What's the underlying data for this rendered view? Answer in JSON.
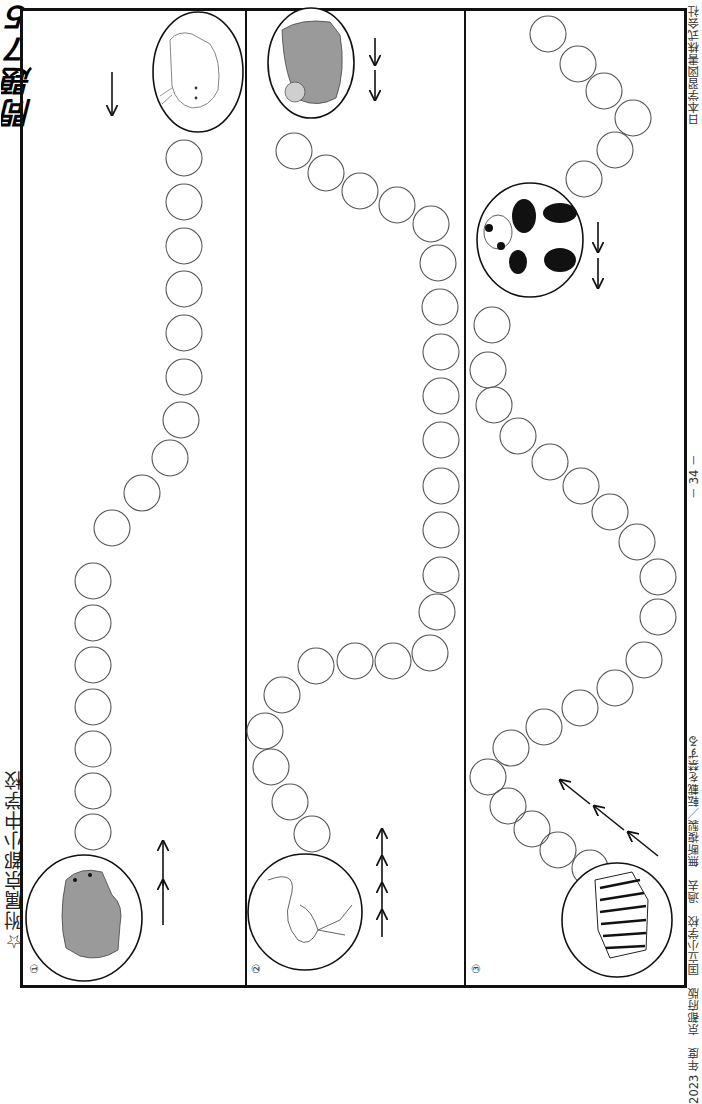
{
  "page": {
    "heading": "問題７５",
    "title": "☆附属京都小中学校",
    "footer": {
      "left": "2023 年度　京都府版　国立小学校　過去　無断複製／転載を禁ずる",
      "page_number": "－ 34 －",
      "right": "日本学習図書株式会社"
    }
  },
  "panels": [
    {
      "number": "①",
      "start_animal": "bear",
      "end_animal": "cat",
      "start_arrows": 2,
      "end_arrows": 1,
      "circle_count": 17
    },
    {
      "number": "②",
      "start_animal": "flamingo",
      "end_animal": "monkey",
      "start_arrows": 4,
      "end_arrows": 2,
      "circle_count": 24
    },
    {
      "number": "③",
      "start_animal": "zebra",
      "end_animal": "panda",
      "start_arrows": 3,
      "end_arrows": 2,
      "circle_count": 28
    }
  ],
  "colors": {
    "frame": "#111111",
    "circle_stroke": "#555555",
    "bear_fill": "#9a9a9a",
    "monkey_fill": "#9a9a9a"
  }
}
